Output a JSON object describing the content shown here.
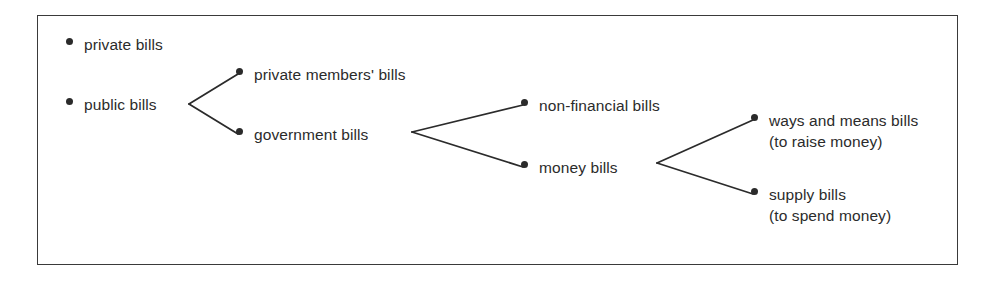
{
  "figure": {
    "type": "tree-diagram",
    "frame": {
      "border_color": "#3a3a3a",
      "background": "#ffffff"
    },
    "ink_color": "#2b2b2b"
  },
  "nodes": [
    {
      "id": "private-bills",
      "label": "private bills",
      "sublabel": "",
      "bullet_x": 69,
      "bullet_y": 41,
      "text_x": 84,
      "text_y": 34,
      "level": 1
    },
    {
      "id": "public-bills",
      "label": "public bills",
      "sublabel": "",
      "bullet_x": 69,
      "bullet_y": 101,
      "text_x": 84,
      "text_y": 94,
      "level": 1
    },
    {
      "id": "private-members-bills",
      "label": "private members' bills",
      "sublabel": "",
      "bullet_x": 239,
      "bullet_y": 71,
      "text_x": 254,
      "text_y": 64,
      "level": 2
    },
    {
      "id": "government-bills",
      "label": "government bills",
      "sublabel": "",
      "bullet_x": 239,
      "bullet_y": 131,
      "text_x": 254,
      "text_y": 124,
      "level": 2
    },
    {
      "id": "non-financial-bills",
      "label": "non-financial bills",
      "sublabel": "",
      "bullet_x": 524,
      "bullet_y": 102,
      "text_x": 539,
      "text_y": 95,
      "level": 3
    },
    {
      "id": "money-bills",
      "label": "money bills",
      "sublabel": "",
      "bullet_x": 524,
      "bullet_y": 164,
      "text_x": 539,
      "text_y": 157,
      "level": 3
    },
    {
      "id": "ways-and-means-bills",
      "label": "ways and means bills",
      "sublabel": "(to raise money)",
      "bullet_x": 754,
      "bullet_y": 117,
      "text_x": 769,
      "text_y": 110,
      "level": 4
    },
    {
      "id": "supply-bills",
      "label": "supply bills",
      "sublabel": "(to spend money)",
      "bullet_x": 754,
      "bullet_y": 191,
      "text_x": 769,
      "text_y": 184,
      "level": 4
    }
  ],
  "edges": [
    {
      "id": "edge-public-to-private-members",
      "from": "public-bills",
      "to": "private-members-bills",
      "vertex_x": 189,
      "vertex_y": 104,
      "end_x": 238,
      "end_y": 74
    },
    {
      "id": "edge-public-to-government",
      "from": "public-bills",
      "to": "government-bills",
      "vertex_x": 189,
      "vertex_y": 104,
      "end_x": 238,
      "end_y": 134
    },
    {
      "id": "edge-government-to-non-financial",
      "from": "government-bills",
      "to": "non-financial-bills",
      "vertex_x": 412,
      "vertex_y": 132,
      "end_x": 523,
      "end_y": 105
    },
    {
      "id": "edge-government-to-money",
      "from": "government-bills",
      "to": "money-bills",
      "vertex_x": 412,
      "vertex_y": 132,
      "end_x": 523,
      "end_y": 167
    },
    {
      "id": "edge-money-to-ways-and-means",
      "from": "money-bills",
      "to": "ways-and-means-bills",
      "vertex_x": 657,
      "vertex_y": 163,
      "end_x": 753,
      "end_y": 120
    },
    {
      "id": "edge-money-to-supply",
      "from": "money-bills",
      "to": "supply-bills",
      "vertex_x": 657,
      "vertex_y": 163,
      "end_x": 753,
      "end_y": 194
    }
  ]
}
